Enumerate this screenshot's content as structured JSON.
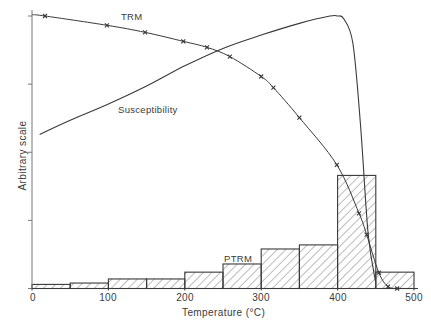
{
  "chart_data": {
    "type": "bar+line",
    "title": "",
    "xlabel": "Temperature (°C)",
    "ylabel": "Arbitrary scale",
    "xlim": [
      0,
      500
    ],
    "xticks": [
      "0",
      "100",
      "200",
      "300",
      "400",
      "500"
    ],
    "y_tick_count": 5,
    "grid": false,
    "histogram": {
      "name": "PTRM",
      "bins": [
        [
          0,
          50
        ],
        [
          50,
          100
        ],
        [
          100,
          150
        ],
        [
          150,
          200
        ],
        [
          200,
          250
        ],
        [
          250,
          300
        ],
        [
          300,
          350
        ],
        [
          350,
          400
        ],
        [
          400,
          450
        ],
        [
          450,
          500
        ]
      ],
      "values": [
        0.015,
        0.02,
        0.035,
        0.035,
        0.06,
        0.09,
        0.145,
        0.16,
        0.415,
        0.06
      ],
      "pattern": "diagonal-hatch"
    },
    "series": [
      {
        "name": "TRM",
        "marker": "x",
        "x": [
          17,
          98,
          148,
          198,
          229,
          259,
          300,
          316,
          350,
          399,
          428,
          438,
          454,
          466,
          478
        ],
        "y": [
          1.0,
          0.966,
          0.94,
          0.907,
          0.885,
          0.851,
          0.778,
          0.737,
          0.627,
          0.454,
          0.276,
          0.198,
          0.058,
          0.007,
          0.0
        ]
      },
      {
        "name": "Susceptibility",
        "marker": "none",
        "x": [
          0,
          50,
          100,
          150,
          200,
          250,
          300,
          350,
          390,
          400,
          408,
          420,
          430,
          440,
          450
        ],
        "y": [
          0.565,
          0.617,
          0.677,
          0.743,
          0.817,
          0.881,
          0.93,
          0.973,
          1.0,
          1.0,
          0.99,
          0.9,
          0.6,
          0.2,
          0.02
        ]
      }
    ],
    "annotations": [
      "TRM",
      "Susceptibility",
      "PTRM"
    ]
  },
  "labels": {
    "xlabel": "Temperature (°C)",
    "ylabel": "Arbitrary scale",
    "trm": "TRM",
    "susceptibility": "Susceptibility",
    "ptrm": "PTRM",
    "xticks": [
      "0",
      "100",
      "200",
      "300",
      "400",
      "500"
    ]
  },
  "colors": {
    "ink": "#3a3a3a",
    "background": "#ffffff"
  }
}
